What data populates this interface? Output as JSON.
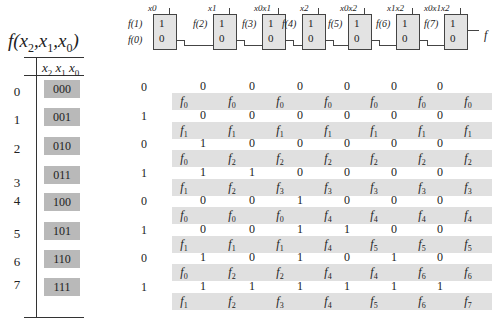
{
  "title": {
    "f": "f",
    "vars": [
      "x",
      "2",
      "x",
      "1",
      "x",
      "0"
    ]
  },
  "table": {
    "header": [
      "x",
      "2",
      "x",
      "1",
      "x",
      "0"
    ],
    "rows": [
      {
        "index": "0",
        "code": "000"
      },
      {
        "index": "1",
        "code": "001"
      },
      {
        "index": "2",
        "code": "010"
      },
      {
        "index": "3",
        "code": "011"
      },
      {
        "index": "4",
        "code": "100"
      },
      {
        "index": "5",
        "code": "101"
      },
      {
        "index": "6",
        "code": "110"
      },
      {
        "index": "7",
        "code": "111"
      }
    ]
  },
  "chain": {
    "inputs": [
      "f(1)",
      "f(0)"
    ],
    "mid_labels": [
      "f(2)",
      "f(3)",
      "f(4)",
      "f(5)",
      "f(6)",
      "f(7)"
    ],
    "output": "f",
    "mux_one": "1",
    "mux_zero": "0",
    "selects": [
      "x0",
      "x1",
      "x0x1",
      "x2",
      "x0x2",
      "x1x2",
      "x0x1x2"
    ]
  },
  "grid": {
    "rows": [
      {
        "x0": "0",
        "bits": [
          "0",
          "0",
          "0",
          "0",
          "0",
          "0",
          "0"
        ],
        "outs": [
          "0",
          "0",
          "0",
          "0",
          "0",
          "0",
          "0"
        ]
      },
      {
        "x0": "1",
        "bits": [
          "0",
          "0",
          "0",
          "0",
          "0",
          "0",
          "0"
        ],
        "outs": [
          "1",
          "1",
          "1",
          "1",
          "1",
          "1",
          "1"
        ]
      },
      {
        "x0": "0",
        "bits": [
          "1",
          "0",
          "0",
          "0",
          "0",
          "0",
          "0"
        ],
        "outs": [
          "0",
          "2",
          "2",
          "2",
          "2",
          "2",
          "2"
        ]
      },
      {
        "x0": "1",
        "bits": [
          "1",
          "1",
          "0",
          "0",
          "0",
          "0",
          "0"
        ],
        "outs": [
          "1",
          "2",
          "3",
          "3",
          "3",
          "3",
          "3"
        ]
      },
      {
        "x0": "0",
        "bits": [
          "0",
          "0",
          "1",
          "0",
          "0",
          "0",
          "0"
        ],
        "outs": [
          "0",
          "0",
          "0",
          "4",
          "4",
          "4",
          "4"
        ]
      },
      {
        "x0": "1",
        "bits": [
          "0",
          "0",
          "1",
          "1",
          "0",
          "0",
          "0"
        ],
        "outs": [
          "1",
          "1",
          "1",
          "4",
          "5",
          "5",
          "5"
        ]
      },
      {
        "x0": "0",
        "bits": [
          "1",
          "0",
          "1",
          "0",
          "1",
          "0",
          "0"
        ],
        "outs": [
          "0",
          "2",
          "2",
          "4",
          "4",
          "6",
          "6"
        ]
      },
      {
        "x0": "1",
        "bits": [
          "1",
          "1",
          "1",
          "1",
          "1",
          "1",
          "0"
        ],
        "outs": [
          "1",
          "2",
          "3",
          "4",
          "5",
          "6",
          "7"
        ]
      }
    ]
  }
}
